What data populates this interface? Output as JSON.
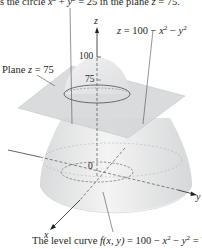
{
  "caption_top": {
    "prefix": "is the circle ",
    "x": "x",
    "plus": " + ",
    "y": "y",
    "eq": " = 25 in the plane ",
    "z": "z",
    "tail": " = 75."
  },
  "surface_label": {
    "z": "z",
    "eq": " = 100 − ",
    "x": "x",
    "minus": " − ",
    "y": "y",
    "exp": "2"
  },
  "plane_label": {
    "prefix": "Plane ",
    "z": "z",
    "tail": " = 75"
  },
  "axes": {
    "z": "z",
    "x": "x",
    "y": "y",
    "origin": "0",
    "tick_100": "100",
    "tick_75": "75"
  },
  "caption_bottom": {
    "prefix": "The level curve ",
    "f": "f",
    "args": "(x, y)",
    "eq": " = 100 − ",
    "x": "x",
    "minus": " − ",
    "y": "y",
    "tail": " = 75",
    "exp": "2"
  },
  "colors": {
    "surface_fill": "#e6e7e8",
    "plane_fill": "#d1d3d4",
    "line": "#231f20"
  }
}
